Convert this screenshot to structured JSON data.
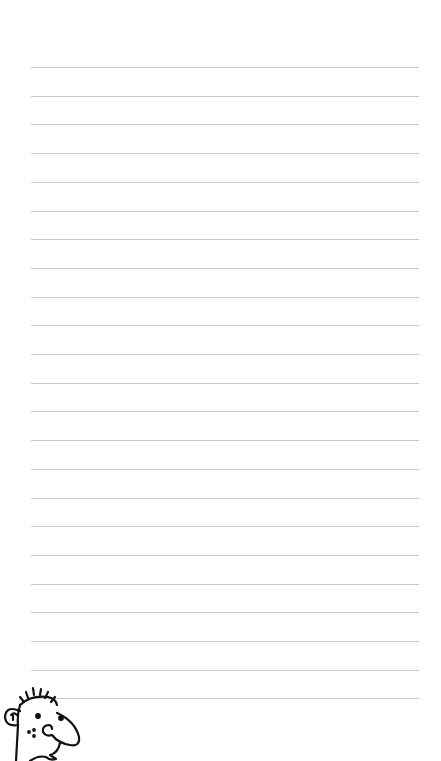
{
  "page": {
    "type": "lined-notebook-page",
    "background": "#ffffff",
    "line_color": "#c9c9c9",
    "line_count": 23,
    "line_start_y": 67,
    "line_spacing": 28.7
  },
  "illustration": {
    "icon": "cartoon-face-icon",
    "description": "doodle face with spiky hair and big nose"
  }
}
